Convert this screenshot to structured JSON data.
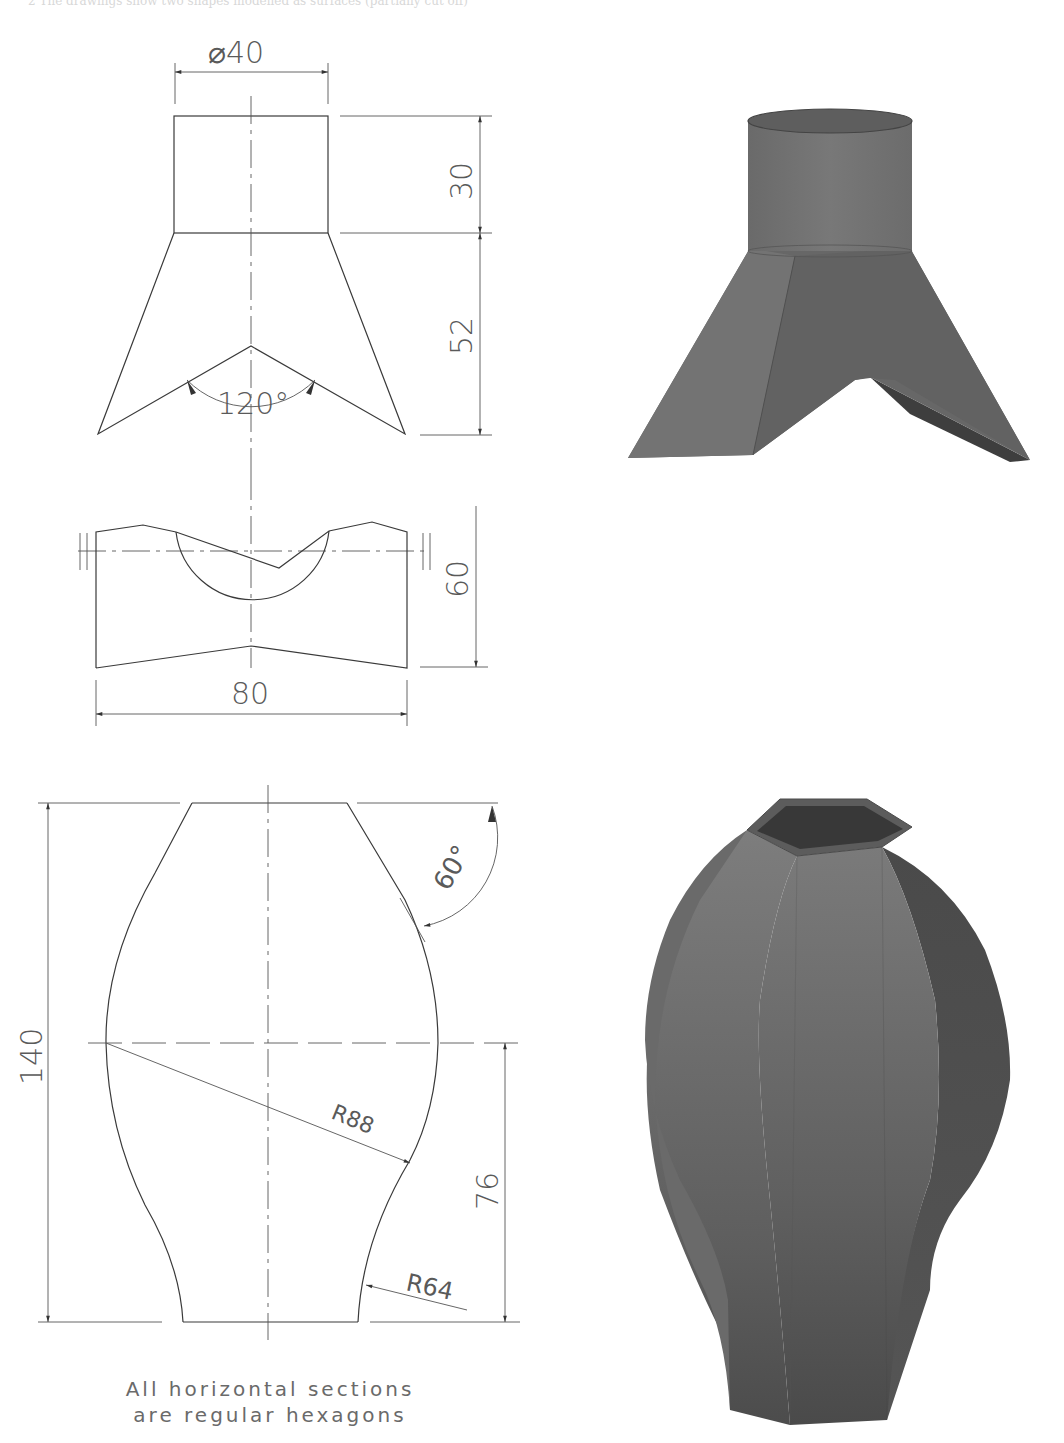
{
  "header": {
    "text": "2   The drawings show two shapes modelled as surfaces (partially cut off)"
  },
  "drawing1": {
    "front_view": {
      "diameter_label": "⌀40",
      "top_height_label": "30",
      "lower_height_label": "52",
      "angle_label": "120°"
    },
    "side_view": {
      "height_label": "60",
      "width_label": "80"
    },
    "render": {
      "name": "cylinder-with-two-legs-3d-model",
      "fill": "#6e6e6e"
    }
  },
  "drawing2": {
    "profile_view": {
      "total_height_label": "140",
      "angle_label": "60°",
      "radius_large_label": "R88",
      "radius_small_label": "R64",
      "lower_height_label": "76"
    },
    "note_line1": "All horizontal sections",
    "note_line2": "are regular hexagons",
    "render": {
      "name": "hexagonal-vase-3d-model",
      "fill": "#5a5a5a"
    }
  },
  "colors": {
    "line": "#3a3a3a",
    "text": "#5a5a5a",
    "shape_light": "#7a7a7a",
    "shape_dark": "#4a4a4a"
  }
}
